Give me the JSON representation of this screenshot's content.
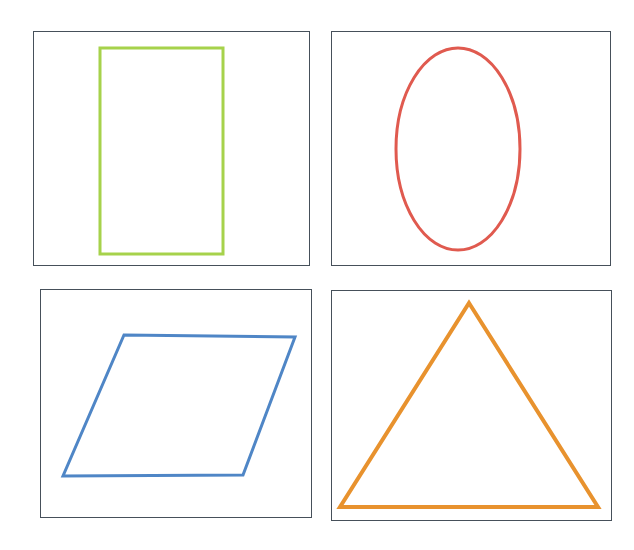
{
  "figure": {
    "width": 634,
    "height": 550,
    "background_color": "#ffffff",
    "panel_border_color": "#46505a",
    "panel_border_width": 1,
    "grid_rows": 2,
    "grid_columns": 2
  },
  "panels": [
    {
      "id": "panel-rectangle",
      "position": "top-left",
      "frame": {
        "x": 33,
        "y": 31,
        "width": 277,
        "height": 235
      },
      "shape": {
        "name": "rectangle",
        "color": "#a6d24b",
        "stroke_width": 3,
        "fill": "none",
        "geometry": {
          "x": 100,
          "y": 48,
          "width": 123,
          "height": 206
        }
      }
    },
    {
      "id": "panel-ellipse",
      "position": "top-right",
      "frame": {
        "x": 331,
        "y": 31,
        "width": 280,
        "height": 235
      },
      "shape": {
        "name": "ellipse",
        "color": "#e05a4f",
        "stroke_width": 3,
        "fill": "none",
        "geometry": {
          "cx": 458,
          "cy": 149,
          "rx": 62,
          "ry": 101
        }
      }
    },
    {
      "id": "panel-parallelogram",
      "position": "bottom-left",
      "frame": {
        "x": 40,
        "y": 289,
        "width": 272,
        "height": 229
      },
      "shape": {
        "name": "parallelogram",
        "color": "#4f86c6",
        "stroke_width": 3,
        "fill": "none",
        "geometry": {
          "points": "124,335 295,337 243,475 63,476"
        }
      }
    },
    {
      "id": "panel-triangle",
      "position": "bottom-right",
      "frame": {
        "x": 331,
        "y": 290,
        "width": 281,
        "height": 231
      },
      "shape": {
        "name": "triangle",
        "color": "#e8922e",
        "stroke_width": 4,
        "fill": "none",
        "geometry": {
          "points": "469,303 598,507 340,507"
        }
      }
    }
  ]
}
